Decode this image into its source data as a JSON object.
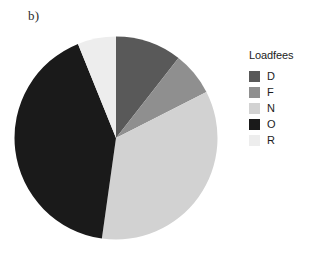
{
  "panel": {
    "label": "b)"
  },
  "legend": {
    "title": "Loadfees",
    "position": "right",
    "items": [
      {
        "label": "D",
        "color": "#595959"
      },
      {
        "label": "F",
        "color": "#8f8f8f"
      },
      {
        "label": "N",
        "color": "#d2d2d2"
      },
      {
        "label": "O",
        "color": "#1a1a1a"
      },
      {
        "label": "R",
        "color": "#ededed"
      }
    ]
  },
  "chart_data": {
    "type": "pie",
    "title": "b)",
    "xlabel": "",
    "ylabel": "",
    "legend_title": "Loadfees",
    "legend_position": "right",
    "grid": false,
    "start_angle_deg": 0,
    "direction": "clockwise",
    "categories": [
      "D",
      "F",
      "N",
      "O",
      "R"
    ],
    "values": [
      10.6,
      6.9,
      34.7,
      41.7,
      6.1
    ],
    "units": "percent",
    "colors": [
      "#595959",
      "#8f8f8f",
      "#d2d2d2",
      "#1a1a1a",
      "#ededed"
    ],
    "slice_order_clockwise_from_top": [
      "D",
      "F",
      "N",
      "O",
      "R"
    ],
    "angles_deg": [
      38,
      25,
      125,
      150,
      22
    ]
  }
}
